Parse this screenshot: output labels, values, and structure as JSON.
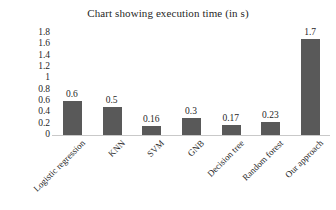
{
  "chart_data": {
    "type": "bar",
    "title": "Chart showing execution time (in s)",
    "xlabel": "",
    "ylabel": "",
    "categories": [
      "Logistic regression",
      "KNN",
      "SVM",
      "GNB",
      "Decision tree",
      "Random forest",
      "Our approach"
    ],
    "values": [
      0.6,
      0.5,
      0.16,
      0.3,
      0.17,
      0.23,
      1.7
    ],
    "value_labels": [
      "0.6",
      "0.5",
      "0.16",
      "0.3",
      "0.17",
      "0.23",
      "1.7"
    ],
    "ylim": [
      0,
      1.8
    ],
    "ytick_labels": [
      "1.8",
      "1.6",
      "1.4",
      "1.2",
      "1",
      "0.8",
      "0.6",
      "0.4",
      "0.2",
      "0"
    ],
    "ytick_values": [
      1.8,
      1.6,
      1.4,
      1.2,
      1.0,
      0.8,
      0.6,
      0.4,
      0.2,
      0
    ],
    "grid": false,
    "legend": false,
    "legend_position": "none",
    "bar_color": "#595959",
    "background_color": "#ffffff",
    "text_color": "#1f1f1f",
    "axis_line_color": "#c9c9c9",
    "category_label_rotation_deg": -45
  }
}
